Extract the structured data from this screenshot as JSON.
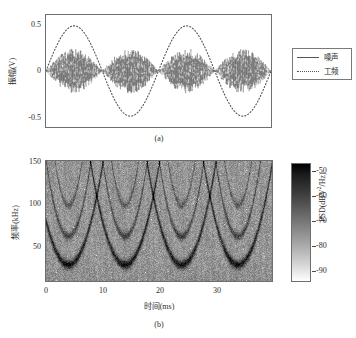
{
  "figure": {
    "panel_a": {
      "caption": "(a)",
      "ylabel": "振幅(V)",
      "y_ticks": [
        "0.5",
        "0",
        "-0.5"
      ],
      "legend": [
        {
          "label": "噪声",
          "style": "solid",
          "color": "#555555"
        },
        {
          "label": "工频",
          "style": "dotted",
          "color": "#555555"
        }
      ]
    },
    "panel_b": {
      "caption": "(b)",
      "xlabel": "时间(ms)",
      "ylabel": "频率(kHz)",
      "x_ticks": [
        "0",
        "10",
        "20",
        "30"
      ],
      "y_ticks": [
        "150",
        "100",
        "50"
      ],
      "colorbar": {
        "title_prefix": "PSD(dBV",
        "title_sup": "2",
        "title_suffix": "/Hz)",
        "ticks": [
          "-50",
          "-60",
          "-70",
          "-80",
          "-90"
        ]
      }
    }
  },
  "chart_data": [
    {
      "type": "line",
      "panel": "(a)",
      "title": "",
      "xlabel": "",
      "ylabel": "振幅(V)",
      "xlim": [
        0,
        40
      ],
      "ylim": [
        -0.62,
        0.62
      ],
      "yticks": [
        0.5,
        0,
        -0.5
      ],
      "grid": false,
      "legend_position": "outside-right",
      "series": [
        {
          "name": "噪声",
          "style": "solid",
          "color": "#2a2a2a",
          "description": "Amplitude-modulated broadband noise burst train; envelope is a rectified sine at 100 Hz equivalent (4 bursts over 40 ms), peak envelope +/-0.25 V, nodes near 0 V at t = 0, 10, 20, 30, 40 ms.",
          "envelope_peak": 0.25,
          "burst_count": 4,
          "burst_centers_ms": [
            5,
            15,
            25,
            35
          ],
          "node_times_ms": [
            0,
            10,
            20,
            30,
            40
          ]
        },
        {
          "name": "工频",
          "style": "dotted",
          "color": "#555555",
          "description": "Power-frequency sinusoid, amplitude 0.5 V, period 20 ms (50 Hz), 2 full cycles across the 40 ms window, peaks at t = 5 and 25 ms, troughs at t = 15 and 35 ms.",
          "amplitude": 0.5,
          "period_ms": 20,
          "frequency_hz": 50,
          "peak_times_ms": [
            5,
            25
          ],
          "trough_times_ms": [
            15,
            35
          ]
        }
      ]
    },
    {
      "type": "heatmap",
      "panel": "(b)",
      "title": "",
      "xlabel": "时间(ms)",
      "ylabel": "频率(kHz)",
      "xlim": [
        0,
        40
      ],
      "ylim": [
        20,
        155
      ],
      "xticks": [
        0,
        10,
        20,
        30
      ],
      "yticks": [
        150,
        100,
        50
      ],
      "colorbar_label": "PSD(dBV2/Hz)",
      "colorbar_ticks": [
        -50,
        -60,
        -70,
        -80,
        -90
      ],
      "colorbar_range": [
        -95,
        -47
      ],
      "colormap": "gray-reversed (black = high PSD, white = low PSD)",
      "grid": false,
      "description": "Spectrogram of the amplitude-modulated noise. Four repeating dark U-shaped (parabolic) ridges, one per 10 ms modulation period, with vertices near 35-40 kHz at t = 4, 14, 24, 34 ms. Each main U is accompanied by two nested weaker arcs with vertices near 70 kHz and 105 kHz. Background speckle noise level about -75 dBV2/Hz; ridge cores reach about -50 dBV2/Hz.",
      "ridge_count": 4,
      "ridge_vertex_times_ms": [
        4,
        14,
        24,
        34
      ],
      "ridge_vertex_frequencies_khz": [
        38,
        70,
        105
      ],
      "background_psd_dbv2hz": -75,
      "ridge_psd_dbv2hz": -50
    }
  ]
}
